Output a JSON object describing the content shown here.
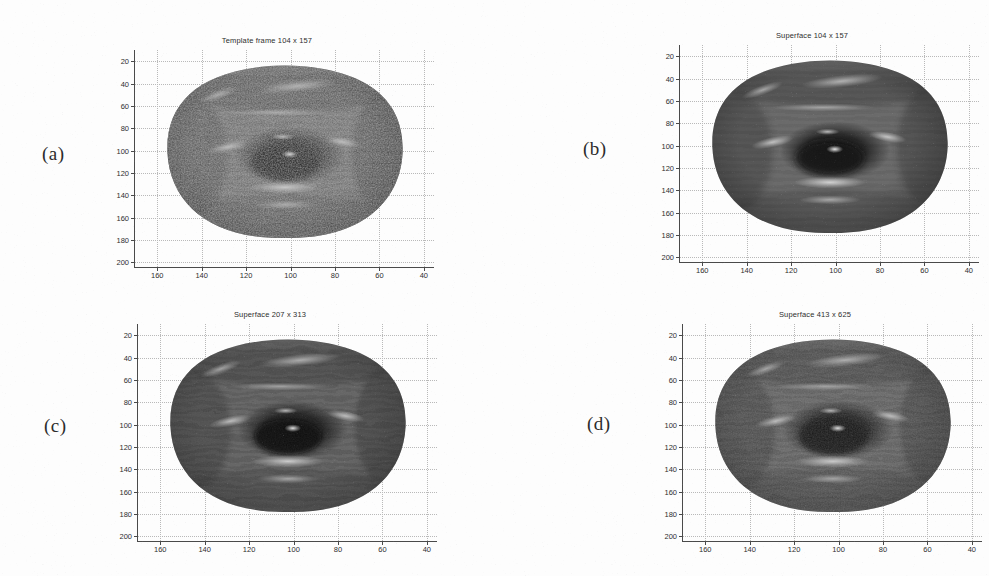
{
  "figure": {
    "background_color": "#fdfdfd",
    "axis_color": "#4a4a4a",
    "grid_color": "#b9b9b9",
    "text_color": "#2e2e2e"
  },
  "axes": {
    "y_ticks": [
      "20",
      "40",
      "60",
      "80",
      "100",
      "120",
      "140",
      "160",
      "180",
      "200"
    ],
    "x_ticks": [
      "160",
      "140",
      "120",
      "100",
      "80",
      "60",
      "40"
    ],
    "y_range": [
      10,
      205
    ],
    "x_range": [
      170,
      35
    ],
    "grid": "on"
  },
  "panels": [
    {
      "key": "a",
      "label": "(a)",
      "title": "Template frame 104 x 157",
      "surface": "textured-noisy",
      "face_shading": {
        "base": "#6f6f6f",
        "shadow": "#1c1c1c",
        "highlight": "#e8e8e8",
        "speckle": 0.85
      }
    },
    {
      "key": "b",
      "label": "(b)",
      "title": "Superface 104 x 157",
      "surface": "smooth",
      "face_shading": {
        "base": "#6a6a6a",
        "shadow": "#141414",
        "highlight": "#f2f2f2",
        "speckle": 0.18
      }
    },
    {
      "key": "c",
      "label": "(c)",
      "title": "Superface 207 x 313",
      "surface": "semi-smooth",
      "face_shading": {
        "base": "#636363",
        "shadow": "#101010",
        "highlight": "#ededed",
        "speckle": 0.32
      }
    },
    {
      "key": "d",
      "label": "(d)",
      "title": "Superface 413 x 625",
      "surface": "detailed",
      "face_shading": {
        "base": "#666666",
        "shadow": "#121212",
        "highlight": "#ebebeb",
        "speckle": 0.5
      }
    }
  ]
}
